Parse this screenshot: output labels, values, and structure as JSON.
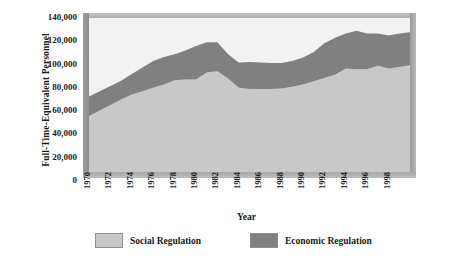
{
  "chart_data": {
    "type": "area",
    "stacked": true,
    "title": "",
    "xlabel": "Year",
    "ylabel": "Full-Time-Equivalent Personnel",
    "ylim": [
      0,
      140000
    ],
    "yticks": [
      "0",
      "20,000",
      "40,000",
      "60,000",
      "80,000",
      "100,000",
      "120,000",
      "140,000"
    ],
    "ytick_values": [
      0,
      20000,
      40000,
      60000,
      80000,
      100000,
      120000,
      140000
    ],
    "xlim": [
      1970,
      2000
    ],
    "xtick_labels": [
      "1970",
      "1972",
      "1974",
      "1976",
      "1978",
      "1980",
      "1982",
      "1984",
      "1986",
      "1988",
      "1990",
      "1992",
      "1994",
      "1996",
      "1998"
    ],
    "xtick_values": [
      1970,
      1972,
      1974,
      1976,
      1978,
      1980,
      1982,
      1984,
      1986,
      1988,
      1990,
      1992,
      1994,
      1996,
      1998
    ],
    "grid": false,
    "legend_position": "bottom",
    "x": [
      1970,
      1971,
      1972,
      1973,
      1974,
      1975,
      1976,
      1977,
      1978,
      1979,
      1980,
      1981,
      1982,
      1983,
      1984,
      1985,
      1986,
      1987,
      1988,
      1989,
      1990,
      1991,
      1992,
      1993,
      1994,
      1995,
      1996,
      1997,
      1998,
      1999,
      2000
    ],
    "series": [
      {
        "name": "Social Regulation",
        "color": "#c8c8c8",
        "values": [
          51000,
          56000,
          61000,
          66000,
          70500,
          73500,
          76500,
          79500,
          83500,
          84000,
          84000,
          90500,
          91500,
          85000,
          76500,
          75500,
          75500,
          75500,
          76000,
          77500,
          79500,
          82500,
          85500,
          88500,
          94000,
          93500,
          93500,
          96500,
          94000,
          95500,
          97000
        ]
      },
      {
        "name": "Economic Regulation",
        "color": "#808080",
        "values": [
          17700,
          17500,
          17200,
          17000,
          18500,
          21500,
          24500,
          25000,
          23500,
          26500,
          30500,
          27500,
          26500,
          22000,
          23000,
          24500,
          24000,
          23500,
          23000,
          23500,
          24500,
          26500,
          31500,
          33500,
          32000,
          35000,
          32500,
          29500,
          30000,
          30500,
          30000
        ]
      }
    ],
    "totals": [
      68700,
      73500,
      78200,
      83000,
      89000,
      95000,
      101000,
      104500,
      107000,
      110500,
      114500,
      118000,
      118000,
      107000,
      99500,
      100000,
      99500,
      99000,
      99000,
      101000,
      104000,
      109000,
      117000,
      122000,
      126000,
      128500,
      126000,
      126000,
      124000,
      126000,
      127000
    ]
  },
  "legend": {
    "items": [
      {
        "label": "Social Regulation",
        "color": "#c8c8c8"
      },
      {
        "label": "Economic Regulation",
        "color": "#808080"
      }
    ]
  },
  "axes": {
    "y_title": "Full-Time-Equivalent Personnel",
    "x_title": "Year"
  }
}
